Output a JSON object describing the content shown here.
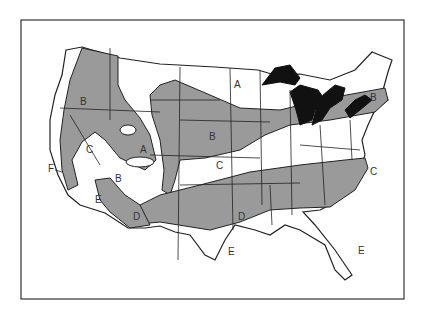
{
  "map": {
    "title": "",
    "colors": {
      "zone_fill": "#9a9a9a",
      "lake_fill": "#111111",
      "outline": "#222222",
      "background": "#ffffff"
    },
    "labels": [
      {
        "text": "A",
        "x": 234,
        "y": 88
      },
      {
        "text": "B",
        "x": 80,
        "y": 105
      },
      {
        "text": "A",
        "x": 140,
        "y": 153
      },
      {
        "text": "B",
        "x": 209,
        "y": 140
      },
      {
        "text": "C",
        "x": 86,
        "y": 153
      },
      {
        "text": "C",
        "x": 216,
        "y": 169
      },
      {
        "text": "F",
        "x": 48,
        "y": 172
      },
      {
        "text": "B",
        "x": 115,
        "y": 182
      },
      {
        "text": "E",
        "x": 95,
        "y": 203
      },
      {
        "text": "D",
        "x": 133,
        "y": 220
      },
      {
        "text": "D",
        "x": 238,
        "y": 220
      },
      {
        "text": "E",
        "x": 228,
        "y": 255
      },
      {
        "text": "E",
        "x": 358,
        "y": 254
      },
      {
        "text": "B",
        "x": 370,
        "y": 101
      },
      {
        "text": "C",
        "x": 370,
        "y": 175
      }
    ]
  }
}
